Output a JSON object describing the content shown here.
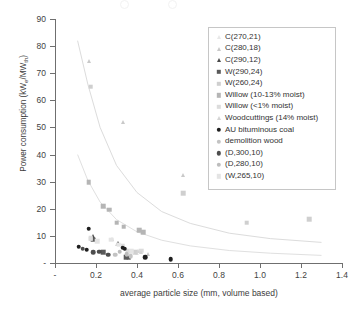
{
  "axes": {
    "y_title": "Power consumption (kWe/MWth)",
    "y_title_main": "Power consumption (kW",
    "y_sub_e": "e",
    "y_mid": "/MW",
    "y_sub_th": "th",
    "y_close": ")",
    "x_title": "average particle size (mm, volume based)",
    "y_ticks": [
      "90",
      "80",
      "70",
      "60",
      "50",
      "40",
      "30",
      "20",
      "10",
      "-"
    ],
    "x_ticks": [
      "-",
      "0.2",
      "0.4",
      "0.6",
      "0.8",
      "1.0",
      "1.2",
      "1.4"
    ]
  },
  "legend": {
    "items": [
      {
        "label": "C(270,21)",
        "shape": "triangle",
        "color": "#e8e8e8"
      },
      {
        "label": "C(280,18)",
        "shape": "triangle",
        "color": "#c9c9c9"
      },
      {
        "label": "C(290,12)",
        "shape": "triangle",
        "color": "#4a4a4a"
      },
      {
        "label": "W(290,24)",
        "shape": "square",
        "color": "#5a5a5a"
      },
      {
        "label": "W(260,24)",
        "shape": "square",
        "color": "#cfcfcf"
      },
      {
        "label": "Willow (10-13% moist)",
        "shape": "square",
        "color": "#b5b5b5"
      },
      {
        "label": "Willow (<1% moist)",
        "shape": "square",
        "color": "#dcdcdc"
      },
      {
        "label": "Woodcuttings (14% moist)",
        "shape": "triangle",
        "color": "#d4d4d4"
      },
      {
        "label": "AU bituminous coal",
        "shape": "circle",
        "color": "#1f1f1f"
      },
      {
        "label": "demolition wood",
        "shape": "circle",
        "color": "#c3c3c3"
      },
      {
        "label": "(D,300,10)",
        "shape": "circle",
        "color": "#4d4d4d"
      },
      {
        "label": "(D,280,10)",
        "shape": "circle",
        "color": "#bdbdbd"
      },
      {
        "label": "(W,265,10)",
        "shape": "square",
        "color": "#e4e4e4"
      }
    ]
  },
  "chart_data": {
    "type": "scatter",
    "title": "",
    "xlabel": "average particle size (mm, volume based)",
    "ylabel": "Power consumption (kWe/MWth)",
    "xlim": [
      0,
      1.4
    ],
    "ylim": [
      0,
      90
    ],
    "grid": false,
    "legend_position": "upper-right",
    "series": [
      {
        "name": "C(270,21)",
        "shape": "triangle",
        "color": "#e8e8e8",
        "points": [
          [
            0.345,
            5.0
          ],
          [
            0.365,
            4.2
          ],
          [
            0.4,
            3.6
          ]
        ]
      },
      {
        "name": "C(280,18)",
        "shape": "triangle",
        "color": "#c9c9c9",
        "points": [
          [
            0.165,
            74.5
          ],
          [
            0.33,
            52.0
          ],
          [
            0.625,
            32.5
          ],
          [
            0.28,
            9.0
          ],
          [
            0.455,
            3.4
          ]
        ]
      },
      {
        "name": "C(290,12)",
        "shape": "triangle",
        "color": "#4a4a4a",
        "points": [
          [
            0.185,
            9.9
          ],
          [
            0.305,
            7.2
          ]
        ]
      },
      {
        "name": "W(290,24)",
        "shape": "square",
        "color": "#5a5a5a",
        "points": [
          [
            0.185,
            8.6
          ],
          [
            0.235,
            4.0
          ],
          [
            0.345,
            2.2
          ],
          [
            0.36,
            1.9
          ]
        ]
      },
      {
        "name": "W(260,24)",
        "shape": "square",
        "color": "#cfcfcf",
        "points": [
          [
            0.175,
            65.0
          ],
          [
            0.625,
            25.8
          ],
          [
            0.935,
            14.8
          ],
          [
            1.24,
            16.2
          ],
          [
            0.175,
            8.9
          ],
          [
            0.39,
            4.0
          ]
        ]
      },
      {
        "name": "Willow (10-13% moist)",
        "shape": "square",
        "color": "#b5b5b5",
        "points": [
          [
            0.165,
            29.7
          ],
          [
            0.235,
            21.0
          ],
          [
            0.265,
            19.6
          ],
          [
            0.3,
            14.8
          ],
          [
            0.335,
            13.4
          ],
          [
            0.41,
            12.0
          ],
          [
            0.43,
            11.3
          ]
        ]
      },
      {
        "name": "Willow (<1% moist)",
        "shape": "square",
        "color": "#dcdcdc",
        "points": [
          [
            0.175,
            9.2
          ],
          [
            0.33,
            6.3
          ],
          [
            0.355,
            4.6
          ],
          [
            0.42,
            4.5
          ]
        ]
      },
      {
        "name": "Woodcuttings (14% moist)",
        "shape": "triangle",
        "color": "#d4d4d4",
        "points": [
          [
            0.3,
            7.0
          ],
          [
            0.405,
            4.4
          ],
          [
            0.42,
            3.9
          ]
        ]
      },
      {
        "name": "AU bituminous coal",
        "shape": "circle",
        "color": "#1f1f1f",
        "points": [
          [
            0.165,
            12.6
          ],
          [
            0.115,
            6.0
          ],
          [
            0.155,
            4.9
          ],
          [
            0.33,
            5.6
          ],
          [
            0.34,
            5.2
          ],
          [
            0.44,
            2.2
          ],
          [
            0.565,
            1.4
          ]
        ]
      },
      {
        "name": "demolition wood",
        "shape": "circle",
        "color": "#c3c3c3",
        "points": [
          [
            0.295,
            3.0
          ],
          [
            0.37,
            2.6
          ]
        ]
      },
      {
        "name": "(D,300,10)",
        "shape": "circle",
        "color": "#4d4d4d",
        "points": [
          [
            0.135,
            5.3
          ],
          [
            0.185,
            3.9
          ],
          [
            0.215,
            4.2
          ],
          [
            0.26,
            3.1
          ]
        ]
      },
      {
        "name": "(D,280,10)",
        "shape": "circle",
        "color": "#bdbdbd",
        "points": [
          [
            0.315,
            4.1
          ],
          [
            0.35,
            3.3
          ]
        ]
      },
      {
        "name": "(W,265,10)",
        "shape": "square",
        "color": "#e4e4e4",
        "points": [
          [
            0.205,
            8.0
          ],
          [
            0.275,
            8.6
          ],
          [
            0.31,
            6.8
          ],
          [
            0.375,
            4.3
          ]
        ]
      }
    ],
    "trend_curves": [
      {
        "name": "upper-fit",
        "color": "#dcdcdc",
        "points": [
          [
            0.11,
            82.0
          ],
          [
            0.16,
            66.0
          ],
          [
            0.22,
            50.0
          ],
          [
            0.3,
            36.0
          ],
          [
            0.4,
            26.0
          ],
          [
            0.52,
            19.0
          ],
          [
            0.66,
            14.6
          ],
          [
            0.85,
            11.0
          ],
          [
            1.05,
            9.0
          ],
          [
            1.3,
            7.6
          ]
        ]
      },
      {
        "name": "lower-fit",
        "color": "#e0e0e0",
        "points": [
          [
            0.11,
            40.0
          ],
          [
            0.16,
            30.5
          ],
          [
            0.22,
            22.5
          ],
          [
            0.3,
            16.0
          ],
          [
            0.4,
            11.5
          ],
          [
            0.52,
            8.4
          ],
          [
            0.66,
            6.3
          ],
          [
            0.85,
            4.6
          ],
          [
            1.05,
            3.6
          ],
          [
            1.3,
            2.8
          ]
        ]
      }
    ]
  }
}
